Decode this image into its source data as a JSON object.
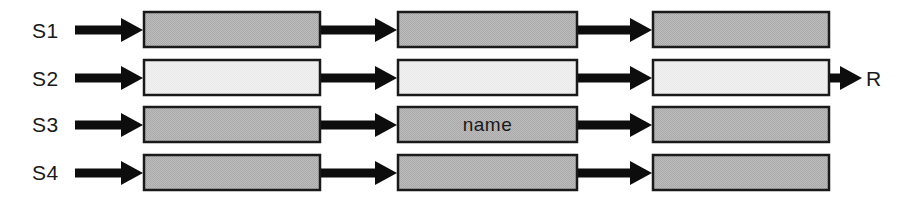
{
  "diagram": {
    "colors": {
      "box_fill_shaded": "#b6b6b6",
      "box_fill_light": "#f0f0f0",
      "box_stroke": "#1a1a1a",
      "arrow": "#0d0d0d",
      "background": "#ffffff",
      "text": "#1a1a1a"
    },
    "stage_labels": [
      {
        "id": "s1",
        "text": "S1",
        "x": 32,
        "y": 20
      },
      {
        "id": "s2",
        "text": "S2",
        "x": 32,
        "y": 68
      },
      {
        "id": "s3",
        "text": "S3",
        "x": 32,
        "y": 114
      },
      {
        "id": "s4",
        "text": "S4",
        "x": 32,
        "y": 162
      }
    ],
    "output_label": {
      "id": "r",
      "text": "R",
      "x": 866,
      "y": 68
    },
    "rows": [
      {
        "id": "row-s1",
        "label": "S1",
        "fill": "shaded",
        "y": 11,
        "height": 37,
        "boxes": [
          {
            "id": "s1-c1",
            "x": 143,
            "width": 178,
            "text": ""
          },
          {
            "id": "s1-c2",
            "x": 397,
            "width": 181,
            "text": ""
          },
          {
            "id": "s1-c3",
            "x": 652,
            "width": 178,
            "text": ""
          }
        ]
      },
      {
        "id": "row-s2",
        "label": "S2",
        "fill": "light",
        "y": 59,
        "height": 37,
        "boxes": [
          {
            "id": "s2-c1",
            "x": 143,
            "width": 178,
            "text": ""
          },
          {
            "id": "s2-c2",
            "x": 397,
            "width": 181,
            "text": ""
          },
          {
            "id": "s2-c3",
            "x": 652,
            "width": 178,
            "text": ""
          }
        ]
      },
      {
        "id": "row-s3",
        "label": "S3",
        "fill": "shaded",
        "y": 106,
        "height": 37,
        "boxes": [
          {
            "id": "s3-c1",
            "x": 143,
            "width": 178,
            "text": ""
          },
          {
            "id": "s3-c2",
            "x": 397,
            "width": 181,
            "text": "name"
          },
          {
            "id": "s3-c3",
            "x": 652,
            "width": 178,
            "text": ""
          }
        ]
      },
      {
        "id": "row-s4",
        "label": "S4",
        "fill": "shaded",
        "y": 154,
        "height": 37,
        "boxes": [
          {
            "id": "s4-c1",
            "x": 143,
            "width": 178,
            "text": ""
          },
          {
            "id": "s4-c2",
            "x": 397,
            "width": 181,
            "text": ""
          },
          {
            "id": "s4-c3",
            "x": 652,
            "width": 178,
            "text": ""
          }
        ]
      }
    ],
    "arrows": [
      {
        "id": "arrow-s1-in",
        "row": "s1",
        "x1": 75,
        "x2": 143,
        "y": 30
      },
      {
        "id": "arrow-s1-a",
        "row": "s1",
        "x1": 321,
        "x2": 397,
        "y": 30
      },
      {
        "id": "arrow-s1-b",
        "row": "s1",
        "x1": 578,
        "x2": 652,
        "y": 30
      },
      {
        "id": "arrow-s2-in",
        "row": "s2",
        "x1": 75,
        "x2": 143,
        "y": 78
      },
      {
        "id": "arrow-s2-a",
        "row": "s2",
        "x1": 321,
        "x2": 397,
        "y": 78
      },
      {
        "id": "arrow-s2-b",
        "row": "s2",
        "x1": 578,
        "x2": 652,
        "y": 78
      },
      {
        "id": "arrow-s2-out",
        "row": "s2",
        "x1": 830,
        "x2": 862,
        "y": 78
      },
      {
        "id": "arrow-s3-in",
        "row": "s3",
        "x1": 75,
        "x2": 143,
        "y": 125
      },
      {
        "id": "arrow-s3-a",
        "row": "s3",
        "x1": 321,
        "x2": 397,
        "y": 125
      },
      {
        "id": "arrow-s3-b",
        "row": "s3",
        "x1": 578,
        "x2": 652,
        "y": 125
      },
      {
        "id": "arrow-s4-in",
        "row": "s4",
        "x1": 75,
        "x2": 143,
        "y": 173
      },
      {
        "id": "arrow-s4-a",
        "row": "s4",
        "x1": 321,
        "x2": 397,
        "y": 173
      },
      {
        "id": "arrow-s4-b",
        "row": "s4",
        "x1": 578,
        "x2": 652,
        "y": 173
      }
    ]
  }
}
